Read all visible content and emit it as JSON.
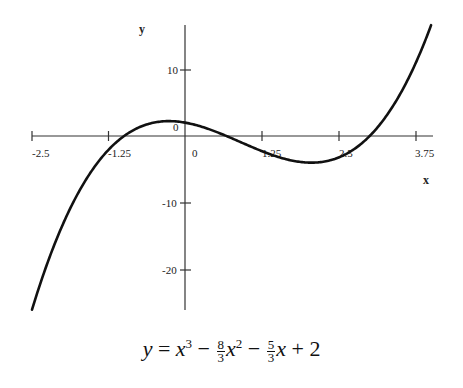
{
  "chart_data": {
    "type": "line",
    "title": "",
    "equation": "y = x^3 - (8/3)x^2 - (5/3)x + 2",
    "equation_parts": {
      "lhs": "y",
      "eq": "=",
      "t1": "x",
      "t1_exp": "3",
      "minus1": "−",
      "f1_num": "8",
      "f1_den": "3",
      "t2": "x",
      "t2_exp": "2",
      "minus2": "−",
      "f2_num": "5",
      "f2_den": "3",
      "t3": "x",
      "plus": "+",
      "const": "2"
    },
    "xlabel": "x",
    "ylabel": "y",
    "x_ticks": [
      "-2.5",
      "-1.25",
      "0",
      "1.25",
      "2.5",
      "3.75"
    ],
    "y_ticks": [
      "10",
      "0",
      "-10",
      "-20"
    ],
    "xlim": [
      -2.5,
      4.0
    ],
    "ylim": [
      -26,
      17
    ],
    "grid": false,
    "series": [
      {
        "name": "y = x^3 - 8/3 x^2 - 5/3 x + 2",
        "x": [
          -2.5,
          -2.0,
          -1.5,
          -1.0,
          -0.5,
          0.0,
          0.5,
          1.0,
          1.5,
          2.0,
          2.5,
          3.0,
          3.5,
          4.0
        ],
        "y": [
          -26.1,
          -13.3,
          -5.1,
          0.0,
          2.2,
          2.0,
          -0.3,
          -1.3,
          -3.1,
          -4.0,
          -3.1,
          0.0,
          6.2,
          17.3
        ]
      }
    ],
    "roots": [
      -1,
      0.667,
      3
    ],
    "color": "#111111"
  }
}
